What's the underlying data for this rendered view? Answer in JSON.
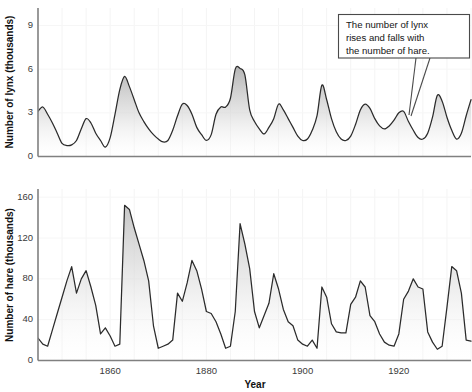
{
  "figure": {
    "annotation": {
      "name": "lynx-hare-callout",
      "line1": "The number of lynx",
      "line2": "rises and falls with",
      "line3": "the number of hare."
    },
    "xlabel": "Year",
    "colors": {
      "line": "#2b2b2b",
      "fill_top": "#b8b8b8",
      "fill_bottom": "#ffffff",
      "grid": "#f4f4f4",
      "axis": "#808080",
      "text": "#141414"
    }
  },
  "chart_data": [
    {
      "id": "lynx",
      "type": "area",
      "title": "",
      "xlabel": "",
      "ylabel": "Number of lynx (thousands)",
      "xlim": [
        1845,
        1935
      ],
      "ylim": [
        0,
        10.2
      ],
      "yticks": [
        0,
        3,
        6,
        9
      ],
      "ytick_labels": [
        "0",
        "3",
        "6",
        "9"
      ],
      "xticks": [
        1860,
        1880,
        1900,
        1920
      ],
      "xtick_labels": [
        "1860",
        "1880",
        "1900",
        "1920"
      ],
      "grid": true,
      "units": "thousands",
      "x": [
        1845,
        1846,
        1847,
        1848,
        1849,
        1850,
        1851,
        1852,
        1853,
        1854,
        1855,
        1856,
        1857,
        1858,
        1859,
        1860,
        1861,
        1862,
        1863,
        1864,
        1865,
        1866,
        1867,
        1868,
        1869,
        1870,
        1871,
        1872,
        1873,
        1874,
        1875,
        1876,
        1877,
        1878,
        1879,
        1880,
        1881,
        1882,
        1883,
        1884,
        1885,
        1886,
        1887,
        1888,
        1889,
        1890,
        1891,
        1892,
        1893,
        1894,
        1895,
        1896,
        1897,
        1898,
        1899,
        1900,
        1901,
        1902,
        1903,
        1904,
        1905,
        1906,
        1907,
        1908,
        1909,
        1910,
        1911,
        1912,
        1913,
        1914,
        1915,
        1916,
        1917,
        1918,
        1919,
        1920,
        1921,
        1922,
        1923,
        1924,
        1925,
        1926,
        1927,
        1928,
        1929,
        1930,
        1931,
        1932,
        1933,
        1934,
        1935
      ],
      "y": [
        3.1,
        3.4,
        2.9,
        2.3,
        1.6,
        0.9,
        0.75,
        0.8,
        1.1,
        1.9,
        2.6,
        2.3,
        1.6,
        1.1,
        0.65,
        1.3,
        2.9,
        4.6,
        5.5,
        4.8,
        3.9,
        3.0,
        2.4,
        1.9,
        1.5,
        1.2,
        1.0,
        1.1,
        1.8,
        2.8,
        3.6,
        3.5,
        2.9,
        2.0,
        1.5,
        1.1,
        1.5,
        2.9,
        3.4,
        3.4,
        4.0,
        6.0,
        6.05,
        5.6,
        3.2,
        2.4,
        1.9,
        1.55,
        2.0,
        2.6,
        3.6,
        3.2,
        2.6,
        2.0,
        1.4,
        1.1,
        1.2,
        1.8,
        2.8,
        4.9,
        3.9,
        2.6,
        1.7,
        1.2,
        1.1,
        1.4,
        2.2,
        3.2,
        3.6,
        3.3,
        2.6,
        2.1,
        1.9,
        2.1,
        2.5,
        3.0,
        3.1,
        2.4,
        1.8,
        1.3,
        1.2,
        1.6,
        2.7,
        4.2,
        3.8,
        2.7,
        1.8,
        1.2,
        1.6,
        2.8,
        3.9
      ]
    },
    {
      "id": "hare",
      "type": "area",
      "title": "",
      "xlabel": "Year",
      "ylabel": "Number of hare (thousands)",
      "xlim": [
        1845,
        1935
      ],
      "ylim": [
        0,
        168
      ],
      "yticks": [
        0,
        40,
        80,
        120,
        160
      ],
      "ytick_labels": [
        "0",
        "40",
        "80",
        "120",
        "160"
      ],
      "xticks": [
        1860,
        1880,
        1900,
        1920
      ],
      "xtick_labels": [
        "1860",
        "1880",
        "1900",
        "1920"
      ],
      "grid": true,
      "units": "thousands",
      "x": [
        1845,
        1846,
        1847,
        1848,
        1849,
        1850,
        1851,
        1852,
        1853,
        1854,
        1855,
        1856,
        1857,
        1858,
        1859,
        1860,
        1861,
        1862,
        1863,
        1864,
        1865,
        1866,
        1867,
        1868,
        1869,
        1870,
        1871,
        1872,
        1873,
        1874,
        1875,
        1876,
        1877,
        1878,
        1879,
        1880,
        1881,
        1882,
        1883,
        1884,
        1885,
        1886,
        1887,
        1888,
        1889,
        1890,
        1891,
        1892,
        1893,
        1894,
        1895,
        1896,
        1897,
        1898,
        1899,
        1900,
        1901,
        1902,
        1903,
        1904,
        1905,
        1906,
        1907,
        1908,
        1909,
        1910,
        1911,
        1912,
        1913,
        1914,
        1915,
        1916,
        1917,
        1918,
        1919,
        1920,
        1921,
        1922,
        1923,
        1924,
        1925,
        1926,
        1927,
        1928,
        1929,
        1930,
        1931,
        1932,
        1933,
        1934,
        1935
      ],
      "y": [
        22,
        16,
        14,
        30,
        46,
        62,
        78,
        92,
        66,
        80,
        88,
        72,
        54,
        26,
        32,
        24,
        14,
        16,
        152,
        148,
        130,
        114,
        98,
        78,
        34,
        12,
        14,
        16,
        20,
        66,
        58,
        76,
        98,
        88,
        70,
        48,
        46,
        38,
        26,
        12,
        14,
        48,
        134,
        114,
        90,
        48,
        32,
        44,
        56,
        85,
        70,
        50,
        38,
        34,
        20,
        16,
        14,
        20,
        12,
        72,
        62,
        36,
        28,
        27,
        27,
        55,
        62,
        78,
        72,
        44,
        38,
        26,
        18,
        15,
        14,
        26,
        60,
        68,
        80,
        72,
        70,
        28,
        18,
        11,
        14,
        52,
        92,
        88,
        66,
        20,
        19
      ]
    }
  ]
}
